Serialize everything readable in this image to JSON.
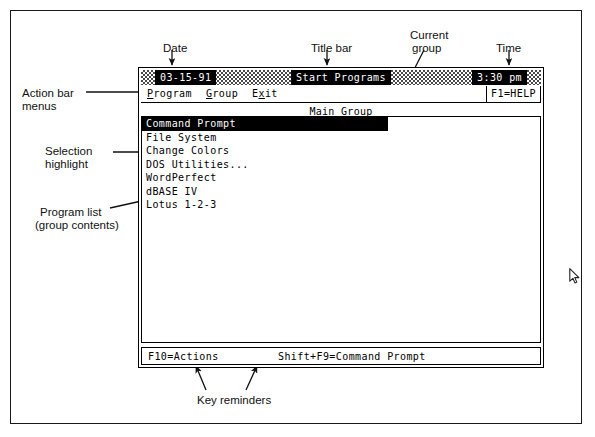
{
  "figure": {
    "caption_free": true
  },
  "annotations": [
    {
      "id": "date",
      "label": "Date",
      "x": 163,
      "y": 42
    },
    {
      "id": "titlebar",
      "label": "Title bar",
      "x": 311,
      "y": 42
    },
    {
      "id": "group",
      "label": "Current",
      "x": 410,
      "y": 29
    },
    {
      "id": "group2",
      "label": "group",
      "x": 412,
      "y": 42
    },
    {
      "id": "time",
      "label": "Time",
      "x": 496,
      "y": 42
    },
    {
      "id": "actionbar",
      "label": "Action bar",
      "x": 22,
      "y": 87
    },
    {
      "id": "actionbar2",
      "label": "menus",
      "x": 22,
      "y": 100
    },
    {
      "id": "selection",
      "label": "Selection",
      "x": 45,
      "y": 145
    },
    {
      "id": "selection2",
      "label": "highlight",
      "x": 45,
      "y": 158
    },
    {
      "id": "proglist",
      "label": "Program list",
      "x": 40,
      "y": 206
    },
    {
      "id": "proglist2",
      "label": "(group contents)",
      "x": 35,
      "y": 219
    },
    {
      "id": "onlinehelp",
      "label": "On-line",
      "x": 494,
      "y": 152
    },
    {
      "id": "onlinehelp2",
      "label": "help",
      "x": 494,
      "y": 165
    },
    {
      "id": "keyrem",
      "label": "Key reminders",
      "x": 197,
      "y": 394
    }
  ],
  "screen": {
    "titlebar": {
      "date": "03-15-91",
      "title": "Start Programs",
      "time": "3:30 pm"
    },
    "menubar": {
      "items": [
        {
          "name": "program-menu",
          "pre": "",
          "mnemonic": "P",
          "post": "rogram"
        },
        {
          "name": "group-menu",
          "pre": "",
          "mnemonic": "G",
          "post": "roup"
        },
        {
          "name": "exit-menu",
          "pre": "E",
          "mnemonic": "x",
          "post": "it"
        }
      ],
      "help_label": "F1=HELP"
    },
    "group": {
      "heading": "Main Group",
      "instruction_line1": "To select an item, use the up and down arrows.",
      "instruction_line2": "To start a program or display a new group, press Enter."
    },
    "programs": [
      {
        "label": "Command Prompt",
        "selected": true
      },
      {
        "label": "File System",
        "selected": false
      },
      {
        "label": "Change Colors",
        "selected": false
      },
      {
        "label": "DOS Utilities...",
        "selected": false
      },
      {
        "label": "WordPerfect",
        "selected": false
      },
      {
        "label": "dBASE IV",
        "selected": false
      },
      {
        "label": "Lotus 1-2-3",
        "selected": false
      }
    ],
    "keybar": {
      "left": "F10=Actions",
      "right": "Shift+F9=Command Prompt"
    }
  },
  "colors": {
    "ink": "#000000",
    "paper": "#ffffff",
    "dither": "#4a4a4a"
  }
}
